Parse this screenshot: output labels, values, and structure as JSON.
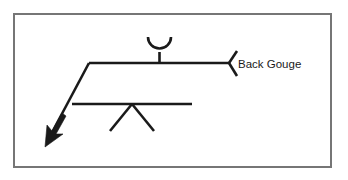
{
  "figure": {
    "background_color": "#ffffff",
    "frame": {
      "name": "border-frame",
      "color": "#767676",
      "x": 13,
      "y": 13,
      "width": 318,
      "height": 154
    }
  },
  "annotations": {
    "tail_note": "Back Gouge"
  },
  "symbol": {
    "line_color": "#1a1a1a",
    "reference_line": {
      "label": "reference-line",
      "x1": 89,
      "y1": 63,
      "x2": 229,
      "y2": 63
    },
    "identification_line": {
      "label": "identification-line",
      "x1": 72,
      "y1": 104,
      "x2": 192,
      "y2": 104
    },
    "leader_line": {
      "label": "leader-line",
      "x1": 89,
      "y1": 63,
      "x2": 48,
      "y2": 141
    },
    "arrowhead": {
      "label": "solid-filled-arrowhead",
      "tip_x": 45,
      "tip_y": 147
    },
    "back_gouge_symbol": {
      "label": "U-shaped back gouge symbol",
      "position": "above reference line",
      "center_x": 159,
      "arc_top_y": 37,
      "arc_bottom_y": 54,
      "radius": 11.5
    },
    "v_groove_symbol": {
      "label": "V-groove weld symbol",
      "position": "below identification line",
      "apex_x": 132,
      "apex_y": 104,
      "left_leg_x": 110,
      "right_leg_x": 154,
      "leg_bottom_y": 131
    },
    "tail": {
      "label": "tail-flag",
      "vertex_x": 229,
      "vertex_y": 63,
      "upper_x": 237,
      "upper_y": 51,
      "lower_x": 237,
      "lower_y": 76
    }
  },
  "text_layout": {
    "back_gouge_x": 238,
    "back_gouge_y": 68
  }
}
